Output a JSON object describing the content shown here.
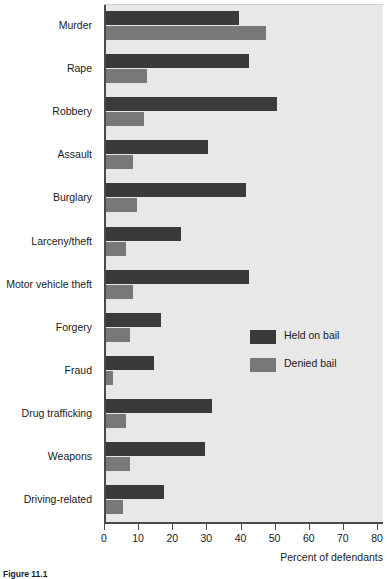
{
  "chart_data": {
    "type": "bar",
    "orientation": "horizontal",
    "title": "",
    "xlabel": "Percent of defendants",
    "ylabel": "",
    "xlim": [
      0,
      80
    ],
    "xticks": [
      0,
      10,
      20,
      30,
      40,
      50,
      60,
      70,
      80
    ],
    "grid": false,
    "legend_position": "middle-right",
    "categories": [
      "Murder",
      "Rape",
      "Robbery",
      "Assault",
      "Burglary",
      "Larceny/theft",
      "Motor vehicle theft",
      "Forgery",
      "Fraud",
      "Drug trafficking",
      "Weapons",
      "Driving-related"
    ],
    "series": [
      {
        "name": "Held on bail",
        "color": "#3a3a3a",
        "values": [
          39,
          42,
          50,
          30,
          41,
          22,
          42,
          16,
          14,
          31,
          29,
          17
        ]
      },
      {
        "name": "Denied bail",
        "color": "#787878",
        "values": [
          47,
          12,
          11,
          8,
          9,
          6,
          8,
          7,
          2,
          6,
          7,
          5
        ]
      }
    ]
  },
  "legend": {
    "items": [
      {
        "label": "Held on bail",
        "color": "#3a3a3a"
      },
      {
        "label": "Denied bail",
        "color": "#787878"
      }
    ]
  },
  "axis": {
    "x_title": "Percent of defendants",
    "tick_labels": [
      "0",
      "10",
      "20",
      "30",
      "40",
      "50",
      "60",
      "70",
      "80"
    ]
  },
  "caption": {
    "text": "Figure 11.1"
  },
  "colors": {
    "plot_background": "#e8e8e8",
    "page_background": "#ffffff",
    "axis": "#4a4a4a",
    "text": "#1a1a1a"
  }
}
